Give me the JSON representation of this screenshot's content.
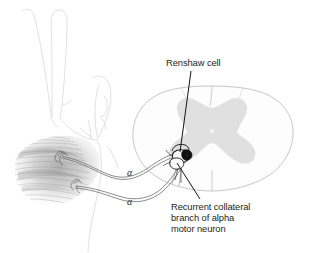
{
  "figure": {
    "background_color": "#ffffff",
    "width": 312,
    "height": 253
  },
  "labels": {
    "renshaw_cell": "Renshaw cell",
    "recurrent_collateral": "Recurrent collateral\nbranch of alpha\nmotor neuron",
    "alpha_upper": "α",
    "alpha_lower": "α"
  },
  "colors": {
    "label_text": "#231f20",
    "leader_line": "#1a1a1a",
    "gray_matter": "#d8d8d8",
    "cord_outline": "#bdbdbd",
    "nerve_fiber": "#6e6e6e",
    "muscle_shade": "#9a9a9a",
    "hand_outline": "#d9d9d9",
    "neuron_dark": "#1c1c1c"
  },
  "structures": {
    "spinal_cord": "spinal-cord-cross-section",
    "gray_matter": "butterfly-gray-matter",
    "hand": "hand-outline",
    "muscle": "skeletal-muscle-fibers",
    "motor_endplate_upper": "motor-endplate",
    "motor_endplate_lower": "motor-endplate",
    "alpha_motor_neuron": "alpha-motor-neuron-soma",
    "renshaw_cell_body": "renshaw-cell-soma",
    "axon_upper": "alpha-motor-axon",
    "axon_lower": "alpha-motor-axon"
  }
}
